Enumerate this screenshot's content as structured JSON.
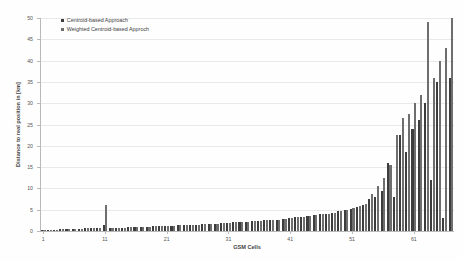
{
  "chart_data": {
    "type": "bar",
    "title": "",
    "xlabel": "GSM Cells",
    "ylabel": "Distance to real position in [km]",
    "ylim": [
      0,
      50
    ],
    "yticks": [
      0,
      5,
      10,
      15,
      20,
      25,
      30,
      35,
      40,
      45,
      50
    ],
    "xticks": [
      1,
      11,
      21,
      31,
      41,
      51,
      61
    ],
    "grid": true,
    "legend_position": "top-left",
    "categories": [
      "1",
      "2",
      "3",
      "4",
      "5",
      "6",
      "7",
      "8",
      "9",
      "10",
      "11",
      "12",
      "13",
      "14",
      "15",
      "16",
      "17",
      "18",
      "19",
      "20",
      "21",
      "22",
      "23",
      "24",
      "25",
      "26",
      "27",
      "28",
      "29",
      "30",
      "31",
      "32",
      "33",
      "34",
      "35",
      "36",
      "37",
      "38",
      "39",
      "40",
      "41",
      "42",
      "43",
      "44",
      "45",
      "46",
      "47",
      "48",
      "49",
      "50",
      "51",
      "52",
      "53",
      "54",
      "55",
      "56",
      "57",
      "58",
      "59",
      "60",
      "61",
      "62",
      "63",
      "64",
      "65",
      "66",
      "67"
    ],
    "series": [
      {
        "name": "Centroid-based Approach",
        "color": "#3d3d3d",
        "values": [
          0.2,
          0.3,
          0.3,
          0.4,
          0.4,
          0.5,
          0.5,
          0.6,
          0.6,
          0.7,
          1.3,
          0.7,
          0.8,
          0.8,
          0.9,
          0.9,
          1.0,
          1.0,
          1.1,
          1.1,
          1.2,
          1.2,
          1.3,
          1.4,
          1.4,
          1.5,
          1.6,
          1.6,
          1.7,
          1.8,
          1.9,
          2.0,
          2.1,
          2.2,
          2.3,
          2.4,
          2.5,
          2.6,
          2.7,
          2.9,
          3.0,
          3.2,
          3.3,
          3.5,
          3.7,
          3.9,
          4.1,
          4.3,
          4.6,
          4.9,
          5.2,
          5.6,
          6.0,
          7.6,
          8.0,
          9.4,
          16.0,
          8.0,
          22.5,
          18.5,
          24.0,
          26.0,
          30.0,
          12.0,
          35.0,
          3.0,
          36.0
        ]
      },
      {
        "name": "Weighted Centroid-based Approch",
        "color": "#6e6e6e",
        "values": [
          0.2,
          0.3,
          0.3,
          0.4,
          0.4,
          0.5,
          0.5,
          0.6,
          0.6,
          0.7,
          6.0,
          0.7,
          0.8,
          0.8,
          0.9,
          0.9,
          1.0,
          1.0,
          1.1,
          1.1,
          1.2,
          1.2,
          1.3,
          1.4,
          1.4,
          1.5,
          1.6,
          1.6,
          1.7,
          1.8,
          1.9,
          2.0,
          2.1,
          2.2,
          2.3,
          2.4,
          2.5,
          2.6,
          2.7,
          2.9,
          3.0,
          3.2,
          3.3,
          3.5,
          3.7,
          3.9,
          4.1,
          4.3,
          4.6,
          4.9,
          5.4,
          5.8,
          6.3,
          8.8,
          10.5,
          12.5,
          15.5,
          22.5,
          26.5,
          27.5,
          30.0,
          32.0,
          49.0,
          36.0,
          40.0,
          43.0,
          50.0
        ]
      }
    ]
  },
  "axes": {
    "y_title": "Distance to real position in [km]",
    "x_title": "GSM Cells"
  },
  "legend": {
    "items": [
      {
        "label": "Centroid-based Approach"
      },
      {
        "label": "Weighted Centroid-based Approch"
      }
    ]
  }
}
